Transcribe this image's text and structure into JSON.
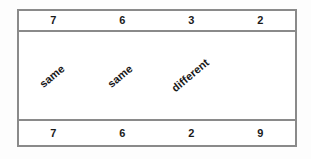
{
  "table": {
    "border_color": "#8a8a8a",
    "text_color": "#1a1a1a",
    "background": "#ffffff",
    "rows": {
      "top_numbers": [
        "7",
        "6",
        "3",
        "2"
      ],
      "comparison_labels": [
        "same",
        "same",
        "different",
        ""
      ],
      "bottom_numbers": [
        "7",
        "6",
        "2",
        "9"
      ]
    }
  }
}
